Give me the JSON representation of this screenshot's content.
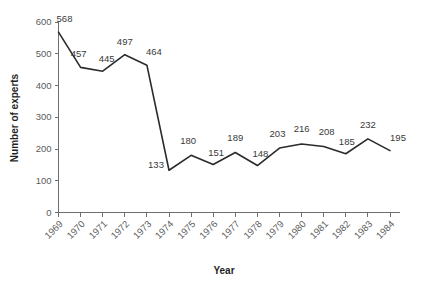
{
  "chart_data": {
    "type": "line",
    "title": "",
    "xlabel": "Year",
    "ylabel": "Number of experts",
    "categories": [
      "1969",
      "1970",
      "1971",
      "1972",
      "1973",
      "1974",
      "1975",
      "1976",
      "1977",
      "1978",
      "1979",
      "1980",
      "1981",
      "1982",
      "1983",
      "1984"
    ],
    "values": [
      568,
      457,
      445,
      497,
      464,
      133,
      180,
      151,
      189,
      148,
      203,
      216,
      208,
      185,
      232,
      195
    ],
    "point_labels": [
      "568",
      "457",
      "445",
      "497",
      "464",
      "133",
      "180",
      "151",
      "189",
      "148",
      "203",
      "216",
      "208",
      "185",
      "232",
      "195"
    ],
    "ylim": [
      0,
      600
    ],
    "yticks": [
      0,
      100,
      200,
      300,
      400,
      500,
      600
    ],
    "ytick_labels": [
      "0",
      "100",
      "200",
      "300",
      "400",
      "500",
      "600"
    ],
    "grid": false,
    "legend": null,
    "series_color": "#2b2b2b",
    "axis_color": "#6e6e6e",
    "label_color": "#5b5b5b",
    "title_color": "#1f1f1f"
  }
}
